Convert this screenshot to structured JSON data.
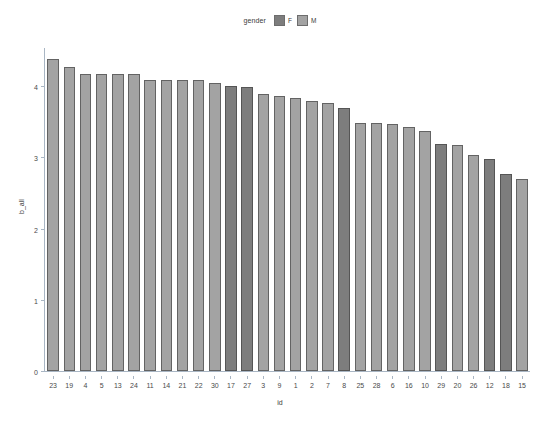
{
  "chart_data": {
    "type": "bar",
    "title": "",
    "xlabel": "id",
    "ylabel": "b_all",
    "ylim": [
      0,
      4.55
    ],
    "yticks": [
      0,
      1,
      2,
      3,
      4
    ],
    "ytick_labels": [
      "0",
      "1",
      "2",
      "3",
      "4"
    ],
    "grid": false,
    "legend": {
      "title": "gender",
      "position": "top",
      "entries": [
        {
          "label": "F",
          "color": "#7d7d7d"
        },
        {
          "label": "M",
          "color": "#a3a3a3"
        }
      ]
    },
    "categories": [
      "23",
      "19",
      "4",
      "5",
      "13",
      "24",
      "11",
      "14",
      "21",
      "22",
      "30",
      "17",
      "27",
      "3",
      "9",
      "1",
      "2",
      "7",
      "8",
      "25",
      "28",
      "6",
      "16",
      "10",
      "29",
      "20",
      "26",
      "12",
      "18",
      "15"
    ],
    "values": [
      4.4,
      4.28,
      4.18,
      4.18,
      4.18,
      4.18,
      4.1,
      4.1,
      4.1,
      4.1,
      4.06,
      4.02,
      4.0,
      3.9,
      3.88,
      3.85,
      3.8,
      3.78,
      3.7,
      3.5,
      3.5,
      3.48,
      3.44,
      3.38,
      3.2,
      3.18,
      3.04,
      2.98,
      2.78,
      2.7
    ],
    "groups": [
      "M",
      "M",
      "M",
      "M",
      "M",
      "M",
      "M",
      "M",
      "M",
      "M",
      "M",
      "F",
      "F",
      "M",
      "M",
      "M",
      "M",
      "M",
      "F",
      "M",
      "M",
      "M",
      "M",
      "M",
      "F",
      "M",
      "M",
      "F",
      "F",
      "M"
    ],
    "colors": {
      "F": "#7d7d7d",
      "M": "#a3a3a3"
    },
    "bars": [
      {
        "id": "23",
        "value": 4.4,
        "gender": "M"
      },
      {
        "id": "19",
        "value": 4.28,
        "gender": "M"
      },
      {
        "id": "4",
        "value": 4.18,
        "gender": "M"
      },
      {
        "id": "5",
        "value": 4.18,
        "gender": "M"
      },
      {
        "id": "13",
        "value": 4.18,
        "gender": "M"
      },
      {
        "id": "24",
        "value": 4.18,
        "gender": "M"
      },
      {
        "id": "11",
        "value": 4.1,
        "gender": "M"
      },
      {
        "id": "14",
        "value": 4.1,
        "gender": "M"
      },
      {
        "id": "21",
        "value": 4.1,
        "gender": "M"
      },
      {
        "id": "22",
        "value": 4.1,
        "gender": "M"
      },
      {
        "id": "30",
        "value": 4.06,
        "gender": "M"
      },
      {
        "id": "17",
        "value": 4.02,
        "gender": "F"
      },
      {
        "id": "27",
        "value": 4.0,
        "gender": "F"
      },
      {
        "id": "3",
        "value": 3.9,
        "gender": "M"
      },
      {
        "id": "9",
        "value": 3.88,
        "gender": "M"
      },
      {
        "id": "1",
        "value": 3.85,
        "gender": "M"
      },
      {
        "id": "2",
        "value": 3.8,
        "gender": "M"
      },
      {
        "id": "7",
        "value": 3.78,
        "gender": "M"
      },
      {
        "id": "8",
        "value": 3.7,
        "gender": "F"
      },
      {
        "id": "25",
        "value": 3.5,
        "gender": "M"
      },
      {
        "id": "28",
        "value": 3.5,
        "gender": "M"
      },
      {
        "id": "6",
        "value": 3.48,
        "gender": "M"
      },
      {
        "id": "16",
        "value": 3.44,
        "gender": "M"
      },
      {
        "id": "10",
        "value": 3.38,
        "gender": "M"
      },
      {
        "id": "29",
        "value": 3.2,
        "gender": "F"
      },
      {
        "id": "20",
        "value": 3.18,
        "gender": "M"
      },
      {
        "id": "26",
        "value": 3.04,
        "gender": "M"
      },
      {
        "id": "12",
        "value": 2.98,
        "gender": "F"
      },
      {
        "id": "18",
        "value": 2.78,
        "gender": "F"
      },
      {
        "id": "15",
        "value": 2.7,
        "gender": "M"
      }
    ]
  }
}
